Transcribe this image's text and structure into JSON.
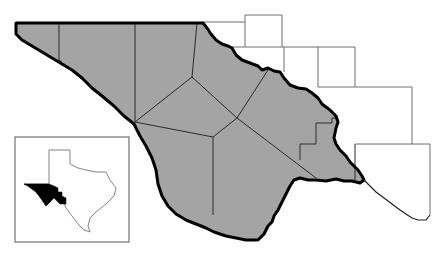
{
  "map": {
    "type": "regional-county-map",
    "description": "Trans-Pecos region of West Texas with county boundaries; locator inset showing region within Texas",
    "colors": {
      "region_fill": "#a4a4a4",
      "border": "#000000",
      "county_lines": "#2a2a2a",
      "neighbor_lines": "#6e6e6e",
      "inset_highlight": "#000000",
      "background": "#ffffff"
    },
    "region_counties_count": 9,
    "inset": {
      "label": "Texas locator map",
      "highlight": "Trans-Pecos region"
    }
  }
}
